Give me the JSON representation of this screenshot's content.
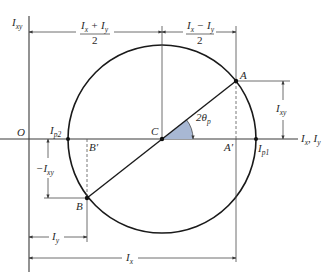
{
  "diagram": {
    "colors": {
      "line": "#1a1a1a",
      "angle_fill": "#a8b8d4",
      "background": "#ffffff"
    },
    "axes": {
      "vertical_label": "I",
      "vertical_sub": "xy",
      "horizontal_label_1": "I",
      "horizontal_sub_1": "x",
      "horizontal_sep": ", ",
      "horizontal_label_2": "I",
      "horizontal_sub_2": "y",
      "origin_label": "O"
    },
    "points": {
      "center": "C",
      "A": "A",
      "B": "B",
      "A_prime": "A′",
      "B_prime": "B′",
      "Ip1_label": "I",
      "Ip1_sub": "p1",
      "Ip2_label": "I",
      "Ip2_sub": "p2"
    },
    "angle": {
      "label": "2θ",
      "sub": "p"
    },
    "dimensions": {
      "avg_numerator": "I",
      "avg_num_sub1": "x",
      "avg_plus": " + ",
      "avg_num_sub2": "y",
      "avg_denominator": "2",
      "half_diff_numerator": "I",
      "half_diff_sub1": "x",
      "half_diff_minus": " − ",
      "half_diff_sub2": "y",
      "half_diff_denominator": "2",
      "Ixy_label": "I",
      "Ixy_sub": "xy",
      "neg_Ixy_prefix": "−I",
      "neg_Ixy_sub": "xy",
      "Iy_label": "I",
      "Iy_sub": "y",
      "Ix_label": "I",
      "Ix_sub": "x"
    }
  }
}
